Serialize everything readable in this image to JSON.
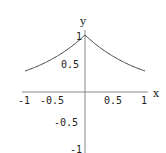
{
  "chart_data": {
    "type": "line",
    "title": "",
    "xlabel": "x",
    "ylabel": "y",
    "xlim": [
      -1,
      1
    ],
    "ylim": [
      -1,
      1
    ],
    "x_ticks": [
      "-1",
      "-0.5",
      "0.5",
      "1"
    ],
    "y_ticks": [
      "1",
      "0.5",
      "-0.5",
      "-1"
    ],
    "grid": false,
    "legend": null,
    "series": [
      {
        "name": "exp(-|x|)",
        "x": [
          -1,
          -0.75,
          -0.5,
          -0.25,
          0,
          0.25,
          0.5,
          0.75,
          1
        ],
        "values": [
          0.37,
          0.47,
          0.61,
          0.78,
          1.0,
          0.78,
          0.61,
          0.47,
          0.37
        ]
      }
    ]
  }
}
